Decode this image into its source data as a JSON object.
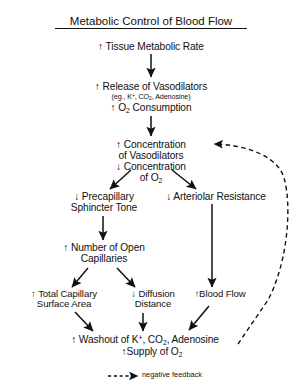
{
  "title": "Metabolic Control of Blood Flow",
  "legend": {
    "label": "negative feedback",
    "style": "dashed-arrow"
  },
  "colors": {
    "background": "#ffffff",
    "ink": "#111111"
  },
  "nodes": {
    "tissue_metabolic_rate": "↑ Tissue Metabolic Rate",
    "release_vasodilators": "↑ Release of Vasodilators",
    "release_vasodilators_examples": "(eg., K",
    "release_vasodilators_examples_2": ", CO",
    "release_vasodilators_examples_3": ", Adenosine)",
    "o2_consumption_pre": "↑ O",
    "o2_consumption_post": " Consumption",
    "concentration_vasodilators_1": "↑ Concentration",
    "concentration_vasodilators_2": "of Vasodilators",
    "concentration_o2_1": "↓ Concentration",
    "concentration_o2_2_pre": "of O",
    "precapillary_1": "↓ Precapillary",
    "precapillary_2": "Sphincter Tone",
    "arteriolar_resistance": "↓ Arteriolar Resistance",
    "open_capillaries_1": "↑ Number of Open",
    "open_capillaries_2": "Capillaries",
    "total_capillary_1": "↑ Total Capillary",
    "total_capillary_2": "Surface Area",
    "diffusion_1": "↓ Diffusion",
    "diffusion_2": "Distance",
    "blood_flow": "↑Blood Flow",
    "washout_pre": "↑ Washout of K",
    "washout_mid": ", CO",
    "washout_post": ", Adenosine",
    "supply_pre": "↑Supply of O"
  },
  "subscripts": {
    "two": "2"
  },
  "superscripts": {
    "plus": "+"
  }
}
